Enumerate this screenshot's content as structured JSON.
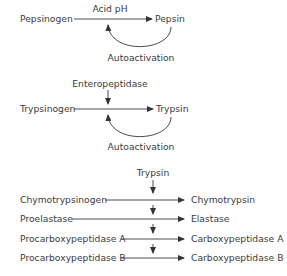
{
  "pepsin_pathway": {
    "precursor": "Pepsinogen",
    "activator": "Acid pH",
    "product": "Pepsin",
    "feedback": "Autoactivation"
  },
  "trypsin_pathway": {
    "precursor": "Trypsinogen",
    "activator": "Enteropeptidase",
    "product": "Trypsin",
    "feedback": "Autoactivation"
  },
  "trypsin_activated": {
    "activator": "Trypsin",
    "rows": [
      {
        "precursor": "Chymotrypsinogen",
        "product": "Chymotrypsin"
      },
      {
        "precursor": "Proelastase",
        "product": "Elastase"
      },
      {
        "precursor": "Procarboxypeptidase A",
        "product": "Carboxypeptidase A"
      },
      {
        "precursor": "Procarboxypeptidase B",
        "product": "Carboxypeptidase B"
      }
    ]
  },
  "colors": {
    "line": "#3a3a3a",
    "text": "#3c3c3c"
  }
}
